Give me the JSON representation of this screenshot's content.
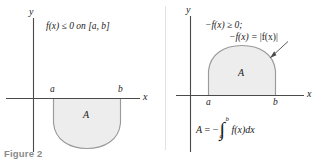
{
  "figure": {
    "caption": "Figure 2",
    "caption_color": "#8a8a8a",
    "background": "#ffffff",
    "region_fill": "#ededed",
    "curve_color": "#9a9a9a",
    "axis_color": "#4a4a4a",
    "divider_color": "#d9d9d9"
  },
  "left_panel": {
    "name": "negative-area-panel",
    "y_axis_label": "y",
    "x_axis_label": "x",
    "condition": "f(x) ≤ 0 on [a, b]",
    "tick_a": "a",
    "tick_b": "b",
    "region_label": "A",
    "region_position": "below-axis",
    "curve_shape": "downward-bowl"
  },
  "right_panel": {
    "name": "reflected-area-panel",
    "y_axis_label": "y",
    "x_axis_label": "x",
    "condition_line1": "−f(x) ≥ 0;",
    "condition_line2_prefix": "−f(x) = ",
    "condition_line2_abs": "|f(x)|",
    "tick_a": "a",
    "tick_b": "b",
    "region_label": "A",
    "region_position": "above-axis",
    "curve_shape": "upward-dome",
    "formula": {
      "lhs": "A",
      "equals": "=",
      "sign": "−",
      "integral_symbol": "∫",
      "lower_limit": "a",
      "upper_limit": "b",
      "integrand": "f(x)dx"
    },
    "annotation_arrow": "leader-arrow-to-curve"
  }
}
